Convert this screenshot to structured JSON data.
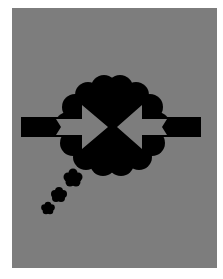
{
  "artwork": {
    "description": "Gray cover artwork with a black thought-bubble cloud containing two gray arrows pointing inward toward each other, with black bars extending left and right, and a trail of three small cloud puffs to the lower left",
    "background_color": "#ffffff",
    "panel_color": "#7d7d7d",
    "shape_color": "#000000",
    "arrow_color": "#7d7d7d"
  }
}
